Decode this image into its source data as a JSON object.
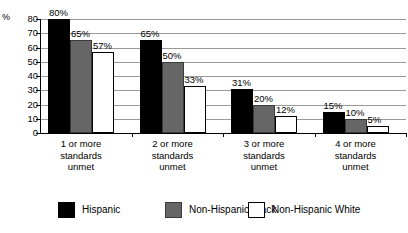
{
  "chart_data": {
    "type": "bar",
    "title": "",
    "subtitle": "",
    "xlabel": "",
    "ylabel": "%",
    "ylim": [
      0,
      80
    ],
    "yticks": [
      "0",
      "10",
      "20",
      "30",
      "40",
      "50",
      "60",
      "70",
      "80"
    ],
    "grid": true,
    "legend_position": "bottom",
    "categories": [
      "1 or more standards unmet",
      "2 or more standards unmet",
      "3 or more standards unmet",
      "4 or more standards unmet"
    ],
    "category_lines": [
      [
        "1 or more",
        "standards",
        "unmet"
      ],
      [
        "2 or more",
        "standards",
        "unmet"
      ],
      [
        "3 or more",
        "standards",
        "unmet"
      ],
      [
        "4 or more",
        "standards",
        "unmet"
      ]
    ],
    "series": [
      {
        "name": "Hispanic",
        "color": "#000000",
        "values": [
          80,
          65,
          31,
          15
        ],
        "labels": [
          "80%",
          "65%",
          "31%",
          "15%"
        ]
      },
      {
        "name": "Non-Hispanic Black",
        "color": "#666666",
        "values": [
          65,
          50,
          20,
          10
        ],
        "labels": [
          "65%",
          "50%",
          "20%",
          "10%"
        ]
      },
      {
        "name": "Non-Hispanic White",
        "color": "#ffffff",
        "values": [
          57,
          33,
          12,
          5
        ],
        "labels": [
          "57%",
          "33%",
          "12%",
          "5%"
        ]
      }
    ]
  },
  "legend": {
    "items": [
      {
        "label": "Hispanic",
        "swatch": "black-swatch"
      },
      {
        "label": "Non-Hispanic Black",
        "swatch": "gray-swatch"
      },
      {
        "label": "Non-Hispanic White",
        "swatch": "white-swatch"
      }
    ]
  }
}
